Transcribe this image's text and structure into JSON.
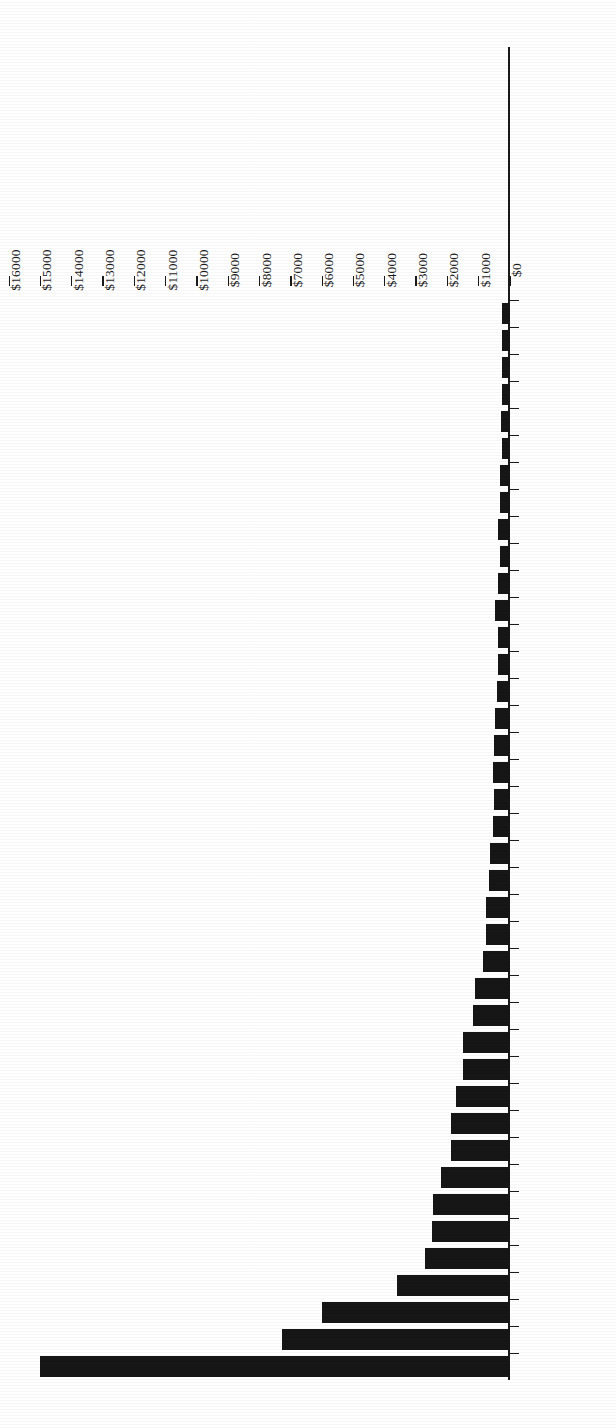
{
  "figure": {
    "orientation_note": "rotated-180",
    "ink_color": "#161616",
    "paper_color": "#ffffff"
  },
  "chart_data": {
    "type": "bar",
    "orientation": "horizontal",
    "title": "",
    "subtitle": "",
    "xlabel": "",
    "ylabel": "",
    "xlim": [
      0,
      16000
    ],
    "grid": false,
    "legend": null,
    "value_prefix": "$",
    "tick_labels": [
      "$16000",
      "$15000",
      "$14000",
      "$13000",
      "$12000",
      "$11000",
      "$10000",
      "$9000",
      "$8000",
      "$7000",
      "$6000",
      "$5000",
      "$4000",
      "$3000",
      "$2000",
      "$1000",
      "$0"
    ],
    "tick_values": [
      16000,
      15000,
      14000,
      13000,
      12000,
      11000,
      10000,
      9000,
      8000,
      7000,
      6000,
      5000,
      4000,
      3000,
      2000,
      1000,
      0
    ],
    "categories": [
      "United States",
      "China",
      "Japan",
      "Germany",
      "France",
      "Brazil",
      "Britain",
      "Italy",
      "Russia",
      "India",
      "Canada",
      "Spain",
      "Australia",
      "Mexico",
      "South Korea",
      "Indonesia",
      "Netherlands",
      "Turkey",
      "Switzerland",
      "Saudi Arabia",
      "Sweden",
      "Poland",
      "Belgium",
      "Norway",
      "Argentina",
      "Austria",
      "South Africa",
      "UAE",
      "Taiwan",
      "Thailand",
      "Denmark",
      "Colombia",
      "Iran",
      "Venezuela",
      "Greece",
      "Malaysia",
      "Finland",
      "Hong Kong",
      "Chile",
      "Nigeria"
    ],
    "values": [
      15000,
      7300,
      6000,
      3600,
      2700,
      2500,
      2450,
      2200,
      1870,
      1870,
      1740,
      1490,
      1490,
      1180,
      1120,
      850,
      770,
      780,
      660,
      650,
      540,
      510,
      530,
      500,
      480,
      400,
      390,
      380,
      470,
      370,
      330,
      370,
      330,
      320,
      250,
      300,
      250,
      260,
      270,
      270
    ],
    "units": "US$ billions"
  }
}
